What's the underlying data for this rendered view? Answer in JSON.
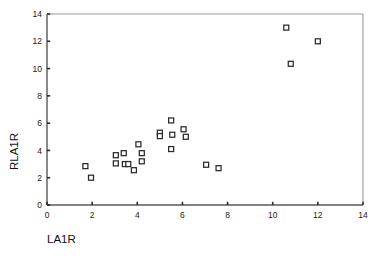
{
  "chart_data": {
    "type": "scatter",
    "title": "",
    "xlabel": "LA1R",
    "ylabel": "RLA1R",
    "xlim": [
      0,
      14
    ],
    "ylim": [
      0,
      14
    ],
    "xticks": [
      0,
      2,
      4,
      6,
      8,
      10,
      12,
      14
    ],
    "yticks": [
      0,
      2,
      4,
      6,
      8,
      10,
      12,
      14
    ],
    "xtick_labels": [
      "0",
      "2",
      "4",
      "6",
      "8",
      "10",
      "12",
      "14"
    ],
    "ytick_labels": [
      "0",
      "2",
      "4",
      "6",
      "8",
      "10",
      "12",
      "14"
    ],
    "grid": false,
    "legend": null,
    "marker_style": "open-square",
    "marker_color": "#2a2a2a",
    "marker_fill": "#ffffff",
    "points": [
      {
        "x": 1.7,
        "y": 2.85
      },
      {
        "x": 1.95,
        "y": 2.0
      },
      {
        "x": 3.05,
        "y": 3.65
      },
      {
        "x": 3.05,
        "y": 3.05
      },
      {
        "x": 3.4,
        "y": 3.8
      },
      {
        "x": 3.45,
        "y": 3.0
      },
      {
        "x": 3.6,
        "y": 3.0
      },
      {
        "x": 3.85,
        "y": 2.55
      },
      {
        "x": 4.05,
        "y": 4.45
      },
      {
        "x": 4.2,
        "y": 3.8
      },
      {
        "x": 4.2,
        "y": 3.2
      },
      {
        "x": 5.0,
        "y": 5.3
      },
      {
        "x": 5.0,
        "y": 5.05
      },
      {
        "x": 5.5,
        "y": 6.2
      },
      {
        "x": 5.55,
        "y": 5.15
      },
      {
        "x": 5.5,
        "y": 4.1
      },
      {
        "x": 6.05,
        "y": 5.55
      },
      {
        "x": 6.15,
        "y": 5.0
      },
      {
        "x": 7.05,
        "y": 2.95
      },
      {
        "x": 7.6,
        "y": 2.7
      },
      {
        "x": 10.6,
        "y": 13.0
      },
      {
        "x": 10.8,
        "y": 10.35
      },
      {
        "x": 12.0,
        "y": 12.0
      }
    ],
    "n_points": 23
  },
  "axes": {
    "x_title": "LA1R",
    "y_title": "RLA1R"
  }
}
